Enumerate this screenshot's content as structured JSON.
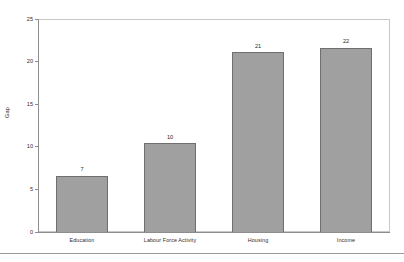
{
  "chart_data": {
    "type": "bar",
    "title": "",
    "xlabel": "",
    "ylabel": "Gap",
    "categories": [
      "Education",
      "Labour Force Activity",
      "Housing",
      "Income"
    ],
    "values": [
      7,
      10,
      21,
      22
    ],
    "bar_heights": [
      6.6,
      10.4,
      21.1,
      21.6
    ],
    "value_labels": [
      "7",
      "10",
      "21",
      "22"
    ],
    "ylim": [
      0,
      25
    ],
    "yticks": [
      0,
      5,
      10,
      15,
      20,
      25
    ],
    "ytick_labels": [
      "0",
      "5",
      "10",
      "15",
      "20",
      "25"
    ],
    "grid": false,
    "legend": false,
    "legend_position": "none",
    "series": [
      {
        "name": "Gap",
        "values": [
          7,
          10,
          21,
          22
        ]
      }
    ]
  },
  "style": {
    "bar_fill": "#a0a0a0",
    "bar_border": "#6f6f6f",
    "axis_color": "#8d8d8d",
    "frame_color": "#c8c8c8",
    "text_color": "#2e2e2e",
    "background": "#ffffff"
  }
}
